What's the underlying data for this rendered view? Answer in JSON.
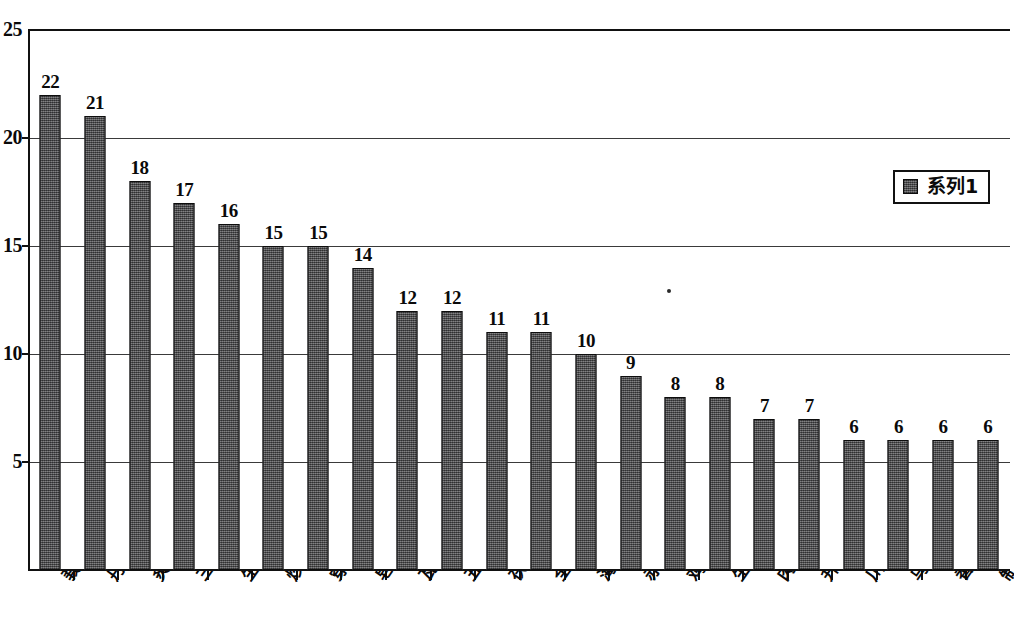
{
  "chart_data": {
    "type": "bar",
    "title": "",
    "subtitle": "",
    "xlabel": "",
    "ylabel": "",
    "ylim": [
      0,
      25
    ],
    "ytick_labels": [
      "5",
      "10",
      "15",
      "20",
      "25"
    ],
    "ytick_values": [
      5,
      10,
      15,
      20,
      25
    ],
    "grid": true,
    "grid_axis": "y",
    "legend_position": "top-right",
    "series": [
      {
        "name": "系列1",
        "values": [
          22,
          21,
          18,
          17,
          16,
          15,
          15,
          14,
          12,
          12,
          11,
          11,
          10,
          9,
          8,
          8,
          7,
          7,
          6,
          6,
          6,
          6
        ]
      }
    ],
    "categories": [
      "莪术",
      "丹参",
      "炙黄芪",
      "三棱",
      "生蒲黄",
      "炒白术",
      "穿山甲",
      "皂角刺",
      "瓦楞子",
      "五灵脂",
      "茯苓",
      "全当归",
      "海蛤壳",
      "赤芍",
      "鸡内金",
      "生牡蛎",
      "肉桂",
      "升麻",
      "川断",
      "乌药",
      "香附",
      "制香附"
    ],
    "data_labels": [
      "22",
      "21",
      "18",
      "17",
      "16",
      "15",
      "15",
      "14",
      "12",
      "12",
      "11",
      "11",
      "10",
      "9",
      "8",
      "8",
      "7",
      "7",
      "6",
      "6",
      "6",
      "6"
    ],
    "bar_color": "#58585a",
    "bar_edge_color": "#0d0d0d",
    "axis_color": "#111111",
    "grid_color": "#3a3a3a",
    "background_color": "#ffffff"
  },
  "legend": {
    "entries": [
      {
        "label": "系列1",
        "color": "#58585a"
      }
    ]
  }
}
